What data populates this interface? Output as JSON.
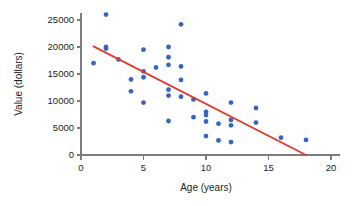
{
  "chart_data": {
    "type": "scatter",
    "title": "",
    "xlabel": "Age (years)",
    "ylabel": "Value (dollars)",
    "xlim": [
      0,
      20
    ],
    "ylim": [
      0,
      27500
    ],
    "xticks": [
      0,
      5,
      10,
      15,
      20
    ],
    "xtick_labels": [
      "0",
      "5",
      "10",
      "15",
      "20"
    ],
    "yticks": [
      0,
      5000,
      10000,
      15000,
      20000,
      25000
    ],
    "ytick_labels": [
      "0",
      "5000",
      "10000",
      "15000",
      "20000",
      "25000"
    ],
    "grid": false,
    "legend": null,
    "point_color": "#3465c4",
    "line_color": "#e33a2e",
    "axis_color": "#7c7c7c",
    "points": [
      {
        "x": 1,
        "y": 17000
      },
      {
        "x": 2,
        "y": 26000
      },
      {
        "x": 2,
        "y": 20000
      },
      {
        "x": 2,
        "y": 19700
      },
      {
        "x": 3,
        "y": 17700
      },
      {
        "x": 4,
        "y": 14000
      },
      {
        "x": 4,
        "y": 11800
      },
      {
        "x": 5,
        "y": 19500
      },
      {
        "x": 5,
        "y": 15500
      },
      {
        "x": 5,
        "y": 14400
      },
      {
        "x": 5,
        "y": 9700
      },
      {
        "x": 6,
        "y": 16200
      },
      {
        "x": 7,
        "y": 20000
      },
      {
        "x": 7,
        "y": 18100
      },
      {
        "x": 7,
        "y": 16700
      },
      {
        "x": 7,
        "y": 12100
      },
      {
        "x": 7,
        "y": 11000
      },
      {
        "x": 7,
        "y": 6300
      },
      {
        "x": 8,
        "y": 24200
      },
      {
        "x": 8,
        "y": 16400
      },
      {
        "x": 8,
        "y": 13900
      },
      {
        "x": 8,
        "y": 10800
      },
      {
        "x": 9,
        "y": 10300
      },
      {
        "x": 9,
        "y": 7000
      },
      {
        "x": 10,
        "y": 11400
      },
      {
        "x": 10,
        "y": 8000
      },
      {
        "x": 10,
        "y": 7400
      },
      {
        "x": 10,
        "y": 6200
      },
      {
        "x": 10,
        "y": 3500
      },
      {
        "x": 11,
        "y": 5800
      },
      {
        "x": 11,
        "y": 2700
      },
      {
        "x": 12,
        "y": 9700
      },
      {
        "x": 12,
        "y": 6500
      },
      {
        "x": 12,
        "y": 5500
      },
      {
        "x": 12,
        "y": 2400
      },
      {
        "x": 14,
        "y": 8700
      },
      {
        "x": 14,
        "y": 6000
      },
      {
        "x": 16,
        "y": 3200
      },
      {
        "x": 18,
        "y": 2800
      }
    ],
    "trend_line": {
      "label": "regression-line",
      "x_start": 1,
      "y_start": 20100,
      "x_end": 18,
      "y_end": 0
    }
  }
}
